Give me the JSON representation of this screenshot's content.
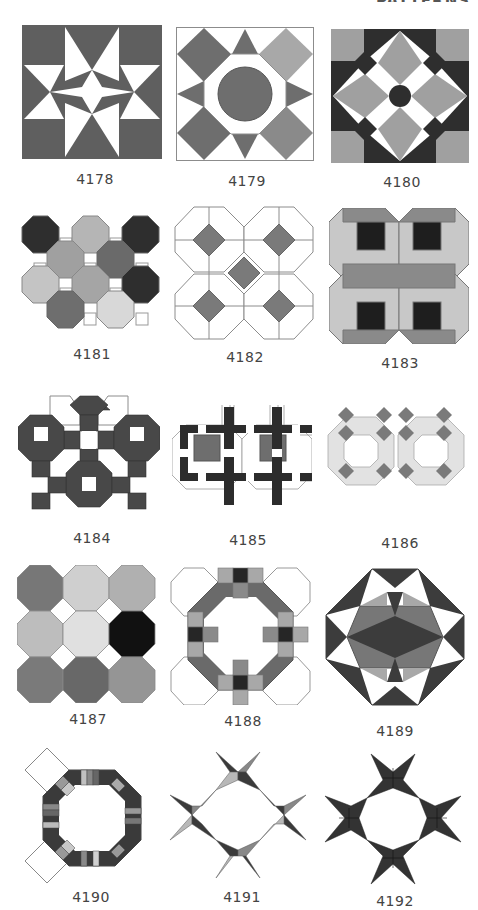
{
  "page": {
    "header_fragment": "PATTERNS",
    "colors": {
      "dark": "#3a3a3a",
      "charcoal": "#2a2a2a",
      "mid": "#6e6e6e",
      "medium": "#8a8a8a",
      "light": "#a8a8a8",
      "pale": "#cfcfcf",
      "lightest": "#e4e4e4",
      "white": "#ffffff",
      "outline": "#8c8c8c"
    },
    "patterns": [
      {
        "id": "4178",
        "label": "4178",
        "description": "Star with white center in dark square block"
      },
      {
        "id": "4179",
        "label": "4179",
        "description": "Central circle in octagon ring with diamond corners"
      },
      {
        "id": "4180",
        "label": "4180",
        "description": "Four diamonds around dark circle with corner squares"
      },
      {
        "id": "4181",
        "label": "4181",
        "description": "Grid of octagons in varied grey tones with small squares"
      },
      {
        "id": "4182",
        "label": "4182",
        "description": "Outlined octagons with grey diamonds"
      },
      {
        "id": "4183",
        "label": "4183",
        "description": "Four octagons with black square centers"
      },
      {
        "id": "4184",
        "label": "4184",
        "description": "Dark octagon rings joined by square chain"
      },
      {
        "id": "4185",
        "label": "4185",
        "description": "Dark lattice crosses over grey squares"
      },
      {
        "id": "4186",
        "label": "4186",
        "description": "Pale octagon rings with grey diamonds"
      },
      {
        "id": "4187",
        "label": "4187",
        "description": "3x3 grid of octagons in grey shades, one black"
      },
      {
        "id": "4188",
        "label": "4188",
        "description": "Octagon ring with checkered squares and white corner octagons"
      },
      {
        "id": "4189",
        "label": "4189",
        "description": "Faceted octagon with triangles and central diamond"
      },
      {
        "id": "4190",
        "label": "4190",
        "description": "Striped octagonal ring with white squares on left"
      },
      {
        "id": "4191",
        "label": "4191",
        "description": "Four pinwheel stars forming ring, mixed greys"
      },
      {
        "id": "4192",
        "label": "4192",
        "description": "Four pinwheel stars forming ring, all dark"
      }
    ]
  }
}
